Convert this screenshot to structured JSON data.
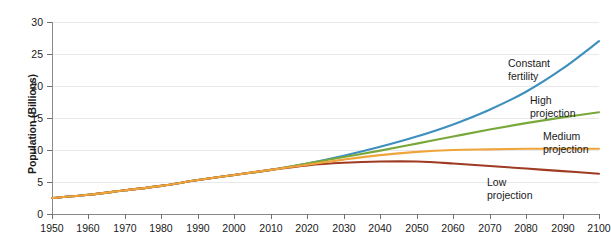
{
  "chart_data": {
    "type": "line",
    "title": "",
    "xlabel": "",
    "ylabel": "Population (Billions)",
    "xlim": [
      1950,
      2100
    ],
    "ylim": [
      0,
      30
    ],
    "grid": true,
    "legend_position": "inline-right-annotations",
    "x_ticks": [
      1950,
      1960,
      1970,
      1980,
      1990,
      2000,
      2010,
      2020,
      2030,
      2040,
      2050,
      2060,
      2070,
      2080,
      2090,
      2100
    ],
    "y_ticks": [
      0,
      5,
      10,
      15,
      20,
      25,
      30
    ],
    "x": [
      1950,
      1960,
      1970,
      1980,
      1990,
      2000,
      2010,
      2020,
      2030,
      2040,
      2050,
      2060,
      2070,
      2080,
      2090,
      2100
    ],
    "series": [
      {
        "name": "Constant fertility",
        "label": "Constant\nfertility",
        "label_line1": "Constant",
        "label_line2": "fertility",
        "color": "#3d8fbe",
        "values": [
          2.5,
          3.0,
          3.7,
          4.4,
          5.3,
          6.1,
          6.9,
          7.9,
          9.1,
          10.5,
          12.1,
          14.0,
          16.3,
          19.1,
          22.7,
          27.0
        ],
        "end_value": 27.0
      },
      {
        "name": "High projection",
        "label": "High\nprojection",
        "label_line1": "High",
        "label_line2": "projection",
        "color": "#79a83a",
        "values": [
          2.5,
          3.0,
          3.7,
          4.4,
          5.3,
          6.1,
          6.9,
          7.9,
          8.9,
          9.9,
          11.0,
          12.1,
          13.2,
          14.2,
          15.1,
          15.9
        ],
        "end_value": 15.9
      },
      {
        "name": "Medium projection",
        "label": "Medium\nprojection",
        "label_line1": "Medium",
        "label_line2": "projection",
        "color": "#f0a43c",
        "values": [
          2.5,
          3.0,
          3.7,
          4.4,
          5.3,
          6.1,
          6.9,
          7.7,
          8.5,
          9.2,
          9.7,
          10.0,
          10.1,
          10.2,
          10.2,
          10.2
        ],
        "end_value": 10.2
      },
      {
        "name": "Low projection",
        "label": "Low\nprojection",
        "label_line1": "Low",
        "label_line2": "projection",
        "color": "#9e3b22",
        "values": [
          2.5,
          3.0,
          3.7,
          4.4,
          5.3,
          6.1,
          6.9,
          7.6,
          8.0,
          8.2,
          8.2,
          7.9,
          7.5,
          7.1,
          6.7,
          6.3
        ],
        "end_value": 6.3
      }
    ],
    "annotations": [
      {
        "text_line1": "Constant",
        "text_line2": "fertility",
        "x_px": 508,
        "y_px": 67
      },
      {
        "text_line1": "High",
        "text_line2": "projection",
        "x_px": 530,
        "y_px": 104
      },
      {
        "text_line1": "Medium",
        "text_line2": "projection",
        "x_px": 543,
        "y_px": 140
      },
      {
        "text_line1": "Low",
        "text_line2": "projection",
        "x_px": 487,
        "y_px": 186
      }
    ]
  }
}
